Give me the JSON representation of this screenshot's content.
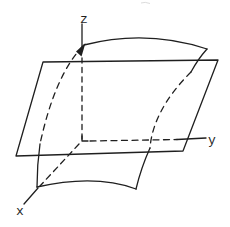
{
  "figure": {
    "axis_labels": {
      "x": "x",
      "y": "y",
      "z": "z"
    },
    "colors": {
      "ink": "#1f1f1f",
      "paper": "#ffffff",
      "artifact": "#dcdcdc"
    }
  }
}
